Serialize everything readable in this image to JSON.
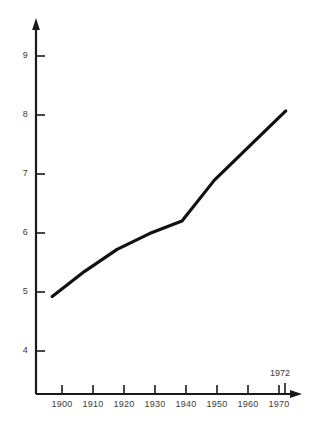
{
  "chart_data": {
    "type": "line",
    "title": "",
    "subtitle": "",
    "xlabel": "",
    "ylabel": "",
    "grid": false,
    "legend": null,
    "legend_position": "none",
    "line_color": "#111111",
    "axis_color": "#1a1a1a",
    "background_color": "#ffffff",
    "xlim": [
      1895,
      1977
    ],
    "ylim": [
      3.6,
      9.45
    ],
    "x_ticks": [
      1900,
      1910,
      1920,
      1930,
      1940,
      1950,
      1960,
      1970
    ],
    "x_tick_labels": [
      "1900",
      "1910",
      "1920",
      "1930",
      "1940",
      "1950",
      "1960",
      "1970"
    ],
    "y_ticks": [
      4,
      5,
      6,
      7,
      8,
      9
    ],
    "y_tick_labels": [
      "4",
      "5",
      "6",
      "7",
      "8",
      "9"
    ],
    "annotations": [
      {
        "text": "1972",
        "x": 1972,
        "y": 3.95,
        "tick": true
      }
    ],
    "x": [
      1900,
      1910,
      1920,
      1930,
      1940,
      1950,
      1960,
      1972
    ],
    "values": [
      5.15,
      5.55,
      5.9,
      6.15,
      6.35,
      7.0,
      7.5,
      8.1
    ],
    "series": [
      {
        "name": "",
        "x": [
          1900,
          1910,
          1920,
          1930,
          1940,
          1950,
          1960,
          1972
        ],
        "values": [
          5.15,
          5.55,
          5.9,
          6.15,
          6.35,
          7.0,
          7.5,
          8.1
        ]
      }
    ]
  },
  "axes": {
    "y_axis_arrow": true,
    "x_axis_arrow": true,
    "y_labels": [
      "9",
      "8",
      "7",
      "6",
      "5",
      "4"
    ],
    "x_labels": [
      "1900",
      "1910",
      "1920",
      "1930",
      "1940",
      "1950",
      "1960",
      "1970"
    ],
    "end_label": "1972"
  }
}
